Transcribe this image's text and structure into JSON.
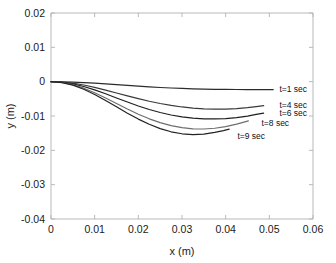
{
  "chart_data": {
    "type": "line",
    "title": "",
    "xlabel": "x (m)",
    "ylabel": "y (m)",
    "xlim": [
      0,
      0.06
    ],
    "ylim": [
      -0.04,
      0.02
    ],
    "xticks": [
      "0",
      "0.01",
      "0.02",
      "0.03",
      "0.04",
      "0.05",
      "0.06"
    ],
    "xtick_values": [
      0,
      0.01,
      0.02,
      0.03,
      0.04,
      0.05,
      0.06
    ],
    "yticks": [
      "0.02",
      "0.01",
      "0",
      "-0.01",
      "-0.02",
      "-0.03",
      "-0.04"
    ],
    "ytick_values": [
      0.02,
      0.01,
      0,
      -0.01,
      -0.02,
      -0.03,
      -0.04
    ],
    "grid": false,
    "legend_position": "inline-right-of-curve-ends",
    "background": "#ffffff",
    "series": [
      {
        "name": "t=1 sec",
        "label": "t=1 sec",
        "color": "#2b2b2b",
        "label_x": 0.0523,
        "label_y": -0.0022,
        "x": [
          0,
          0.0025,
          0.005,
          0.0075,
          0.01,
          0.0125,
          0.015,
          0.0175,
          0.02,
          0.0225,
          0.025,
          0.0275,
          0.03,
          0.0325,
          0.035,
          0.0375,
          0.04,
          0.0425,
          0.045,
          0.0475,
          0.0509
        ],
        "y": [
          0,
          -3e-05,
          -0.00012,
          -0.00026,
          -0.00044,
          -0.00065,
          -0.00088,
          -0.0011,
          -0.00132,
          -0.00152,
          -0.0017,
          -0.00185,
          -0.00198,
          -0.00208,
          -0.00216,
          -0.00222,
          -0.00226,
          -0.00228,
          -0.00229,
          -0.0023,
          -0.0023
        ]
      },
      {
        "name": "t=4 sec",
        "label": "t=4 sec",
        "color": "#3a3a3a",
        "label_x": 0.0523,
        "label_y": -0.0068,
        "x": [
          0,
          0.0025,
          0.005,
          0.0075,
          0.01,
          0.0125,
          0.015,
          0.0175,
          0.02,
          0.0225,
          0.025,
          0.0275,
          0.03,
          0.0325,
          0.035,
          0.0375,
          0.04,
          0.0425,
          0.045,
          0.047,
          0.0487
        ],
        "y": [
          0,
          -0.00012,
          -0.00045,
          -0.00098,
          -0.00166,
          -0.00245,
          -0.0033,
          -0.00415,
          -0.00496,
          -0.0057,
          -0.00636,
          -0.00692,
          -0.00737,
          -0.0077,
          -0.0079,
          -0.00799,
          -0.00797,
          -0.00784,
          -0.00757,
          -0.00725,
          -0.007
        ]
      },
      {
        "name": "t=6 sec",
        "label": "t=6 sec",
        "color": "#1f1f1f",
        "label_x": 0.0523,
        "label_y": -0.0092,
        "x": [
          0,
          0.0025,
          0.005,
          0.0075,
          0.01,
          0.0125,
          0.015,
          0.0175,
          0.02,
          0.0225,
          0.025,
          0.0275,
          0.03,
          0.0325,
          0.035,
          0.0375,
          0.04,
          0.0425,
          0.045,
          0.047,
          0.0487
        ],
        "y": [
          0,
          -0.00018,
          -0.00066,
          -0.00142,
          -0.0024,
          -0.00353,
          -0.00474,
          -0.00594,
          -0.00708,
          -0.0081,
          -0.00898,
          -0.0097,
          -0.01025,
          -0.01062,
          -0.01082,
          -0.01086,
          -0.01075,
          -0.01048,
          -0.01003,
          -0.00955,
          -0.00915
        ]
      },
      {
        "name": "t=8 sec",
        "label": "t=8 sec",
        "color": "#6e6e6e",
        "label_x": 0.0482,
        "label_y": -0.012,
        "x": [
          0,
          0.0025,
          0.005,
          0.0075,
          0.01,
          0.0125,
          0.015,
          0.0175,
          0.02,
          0.0225,
          0.025,
          0.0275,
          0.03,
          0.0325,
          0.035,
          0.0375,
          0.04,
          0.0425,
          0.044,
          0.0452
        ],
        "y": [
          0,
          -0.00024,
          -0.00088,
          -0.0019,
          -0.00322,
          -0.00474,
          -0.00636,
          -0.00797,
          -0.00948,
          -0.01082,
          -0.01194,
          -0.01281,
          -0.01341,
          -0.01373,
          -0.01378,
          -0.01357,
          -0.0131,
          -0.01238,
          -0.01184,
          -0.0114
        ]
      },
      {
        "name": "t=9 sec",
        "label": "t=9 sec",
        "color": "#222222",
        "label_x": 0.0427,
        "label_y": -0.0157,
        "x": [
          0,
          0.0025,
          0.005,
          0.0075,
          0.01,
          0.0125,
          0.015,
          0.0175,
          0.02,
          0.0225,
          0.025,
          0.0275,
          0.03,
          0.0325,
          0.035,
          0.0375,
          0.0395,
          0.0408
        ],
        "y": [
          0,
          -0.00028,
          -0.00102,
          -0.0022,
          -0.00372,
          -0.00547,
          -0.00733,
          -0.00918,
          -0.0109,
          -0.01242,
          -0.01367,
          -0.0146,
          -0.01518,
          -0.0154,
          -0.01527,
          -0.01479,
          -0.01425,
          -0.01382
        ]
      }
    ]
  }
}
